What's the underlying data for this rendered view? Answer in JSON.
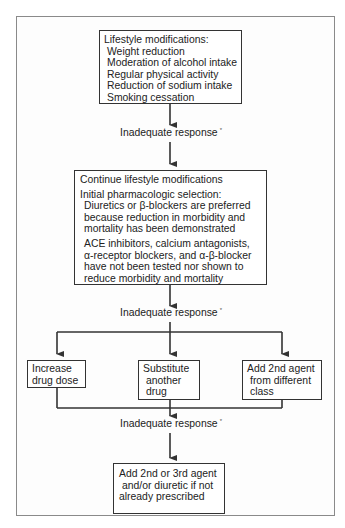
{
  "diagram": {
    "boxes": {
      "lifestyle": {
        "title": "Lifestyle modifications:",
        "items": [
          "Weight reduction",
          "Moderation of alcohol intake",
          "Regular physical activity",
          "Reduction of sodium intake",
          "Smoking cessation"
        ]
      },
      "pharmacologic": {
        "line1": "Continue lifestyle modifications",
        "line2": "Initial pharmacologic selection:",
        "para1": [
          "Diuretics or β-blockers are preferred",
          "because reduction in morbidity and",
          "mortality has been demonstrated"
        ],
        "para2": [
          "ACE inhibitors, calcium antagonists,",
          "α-receptor blockers, and α-β-blocker",
          "have not been tested nor shown to",
          "reduce morbidity and mortality"
        ]
      },
      "increase_dose": {
        "lines": [
          "Increase",
          "drug dose"
        ]
      },
      "substitute": {
        "lines": [
          "Substitute",
          "another",
          "drug"
        ]
      },
      "add_second": {
        "lines": [
          "Add 2nd agent",
          "from different",
          "class"
        ]
      },
      "final": {
        "lines": [
          "Add 2nd or 3rd agent",
          "and/or diuretic if not",
          "already prescribed"
        ]
      }
    },
    "labels": {
      "inadequate_1": "Inadequate response",
      "inadequate_2": "Inadequate response",
      "inadequate_3": "Inadequate response",
      "footnote_mark": "*"
    },
    "colors": {
      "frame_border": "#8a8a8a",
      "box_border": "#333333",
      "line": "#333333",
      "background": "#ffffff"
    }
  }
}
